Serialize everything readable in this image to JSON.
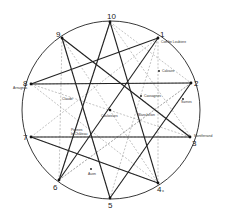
{
  "diagram": {
    "type": "decagram-on-circle",
    "circle": {
      "cx": 112,
      "cy": 112,
      "r": 90,
      "color": "#222222"
    },
    "solid_color": "#222222",
    "dashed_color": "#9a9a9a",
    "outer_points": [
      {
        "id": "10",
        "label": "10",
        "x": 110,
        "y": 22,
        "place": ""
      },
      {
        "id": "1",
        "label": "1",
        "x": 158,
        "y": 38,
        "place": "Combe Loubiere"
      },
      {
        "id": "2",
        "label": "2",
        "x": 191,
        "y": 83,
        "place": ""
      },
      {
        "id": "3",
        "label": "3",
        "x": 190,
        "y": 137,
        "place": "Montferrand"
      },
      {
        "id": "4",
        "label": "4",
        "x": 158,
        "y": 183,
        "place": "",
        "suffix": "x"
      },
      {
        "id": "5",
        "label": "5",
        "x": 110,
        "y": 198,
        "place": ""
      },
      {
        "id": "6",
        "label": "6",
        "x": 59,
        "y": 180,
        "place": ""
      },
      {
        "id": "7",
        "label": "7",
        "x": 31,
        "y": 137,
        "place": ""
      },
      {
        "id": "8",
        "label": "8",
        "x": 31,
        "y": 84,
        "place": "Arnugnac"
      },
      {
        "id": "9",
        "label": "9",
        "x": 62,
        "y": 38,
        "place": ""
      }
    ],
    "inner_points": [
      {
        "name": "Couloisses",
        "x": 110,
        "y": 110
      },
      {
        "name": "Calvaire",
        "x": 159,
        "y": 71
      },
      {
        "name": "Cassagnes",
        "x": 141,
        "y": 96
      },
      {
        "name": "Sarnes",
        "x": 183,
        "y": 99
      },
      {
        "name": "Blanchelon",
        "x": 140,
        "y": 113
      },
      {
        "name": "Claude",
        "x": 67,
        "y": 98
      },
      {
        "name": "Pennes le Château",
        "x": 85,
        "y": 128
      },
      {
        "name": "Auen",
        "x": 91,
        "y": 169
      }
    ],
    "labels": {
      "n10": "10",
      "n1": "1",
      "n2": "2",
      "n3": "3",
      "n4": "4",
      "n4x": "x",
      "n5": "5",
      "n6": "6",
      "n7": "7",
      "n8": "8",
      "n9": "9",
      "combe": "Combe Loubiere",
      "calvaire": "Calvaire",
      "cassagnes": "Cassagnes",
      "sarnes": "Sarnes",
      "blanchelon": "Blanchelon",
      "couloisses": "Couloisses",
      "claude": "Claude",
      "pennes1": "Pennes",
      "pennes2": "le Château",
      "auen": "Auen",
      "montferrand": "Montferrand",
      "arnugnac": "Arnugnac"
    }
  }
}
